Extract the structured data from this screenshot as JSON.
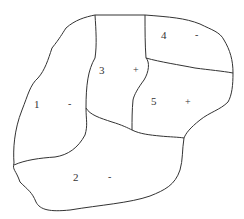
{
  "diagram": {
    "type": "region-map",
    "regions": [
      {
        "id": "1",
        "label": "1",
        "sign": "-"
      },
      {
        "id": "2",
        "label": "2",
        "sign": "-"
      },
      {
        "id": "3",
        "label": "3",
        "sign": "+"
      },
      {
        "id": "4",
        "label": "4",
        "sign": "-"
      },
      {
        "id": "5",
        "label": "5",
        "sign": "+"
      }
    ],
    "colors": {
      "line": "#333333",
      "background": "#ffffff"
    }
  }
}
